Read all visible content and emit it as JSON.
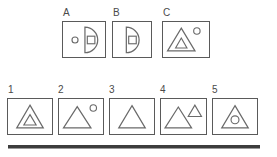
{
  "puzzle": {
    "type": "visual-analogy-matrix",
    "prompt_row": {
      "label_a": "A",
      "label_b": "B",
      "label_c": "C",
      "panels": [
        {
          "key": "A",
          "label": "A",
          "shapes": [
            "small-circle-left",
            "half-disc-flat-left",
            "small-square-inside-half-disc"
          ]
        },
        {
          "key": "B",
          "label": "B",
          "shapes": [
            "half-disc-flat-left",
            "small-square-inside-half-disc"
          ]
        },
        {
          "key": "C",
          "label": "C",
          "shapes": [
            "large-triangle",
            "small-triangle-inside",
            "small-circle-upper-right"
          ]
        }
      ]
    },
    "answer_row": {
      "options": [
        {
          "key": "1",
          "label": "1",
          "shapes": [
            "large-triangle",
            "small-triangle-inside"
          ]
        },
        {
          "key": "2",
          "label": "2",
          "shapes": [
            "large-triangle",
            "small-circle-upper-right"
          ]
        },
        {
          "key": "3",
          "label": "3",
          "shapes": [
            "large-triangle"
          ]
        },
        {
          "key": "4",
          "label": "4",
          "shapes": [
            "large-triangle",
            "small-triangle-upper-right-outside"
          ]
        },
        {
          "key": "5",
          "label": "5",
          "shapes": [
            "large-triangle",
            "small-circle-inside"
          ]
        }
      ]
    },
    "colors": {
      "stroke": "#5a5a5a",
      "shape_stroke": "#6a6a6a",
      "text": "#4a4a4a",
      "rule": "#3d3d3d",
      "background": "#ffffff"
    }
  }
}
